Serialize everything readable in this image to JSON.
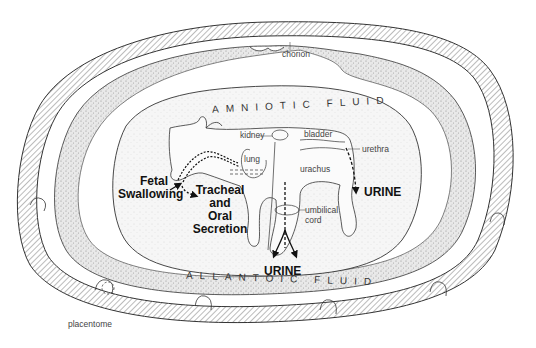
{
  "diagram": {
    "type": "anatomical-cross-section",
    "regions": {
      "amniotic_fluid_label": "AMNIOTIC FLUID",
      "allantoic_fluid_label": "ALLANTOIC FLUID"
    },
    "structure_labels": {
      "chorion": "chorion",
      "kidney": "kidney",
      "bladder": "bladder",
      "urethra": "urethra",
      "lung": "lung",
      "urachus": "urachus",
      "umbilical_cord": "umbilical\ncord",
      "umbilical_cord_line1": "umbilical",
      "umbilical_cord_line2": "cord",
      "placentome": "placentome"
    },
    "flow_labels": {
      "fetal_swallowing_line1": "Fetal",
      "fetal_swallowing_line2": "Swallowing",
      "tracheal_line1": "Tracheal",
      "tracheal_line2": "and",
      "tracheal_line3": "Oral",
      "tracheal_line4": "Secretion",
      "urine_amniotic": "URINE",
      "urine_allantoic": "URINE"
    },
    "colors": {
      "line": "#333333",
      "stipple": "#c8c8c8",
      "hatch": "#555555",
      "background": "#ffffff"
    }
  }
}
